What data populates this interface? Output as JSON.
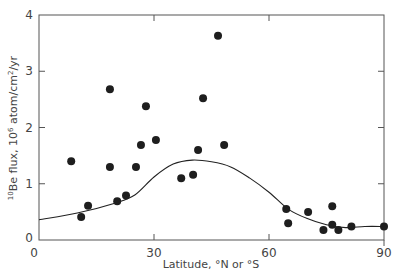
{
  "chart_data": {
    "type": "scatter",
    "title": "",
    "xlabel": "Latitude, °N or °S",
    "ylabel_parts": {
      "mass": "10",
      "element": "Be flux, 10",
      "exp": "6",
      "unit1": " atom/cm",
      "sq": "2",
      "unit2": "/yr"
    },
    "ylabel": "10Be flux, 10^6 atom/cm^2/yr",
    "xlim": [
      0,
      90
    ],
    "ylim": [
      0,
      4
    ],
    "xticks": [
      0,
      30,
      60,
      90
    ],
    "yticks": [
      0,
      1,
      2,
      3,
      4
    ],
    "grid": false,
    "legend": null,
    "series": [
      {
        "name": "observations",
        "kind": "scatter",
        "points": [
          [
            8.4,
            1.4
          ],
          [
            11.0,
            0.41
          ],
          [
            12.8,
            0.61
          ],
          [
            18.5,
            2.68
          ],
          [
            18.5,
            1.3
          ],
          [
            20.4,
            0.69
          ],
          [
            22.7,
            0.79
          ],
          [
            25.3,
            1.3
          ],
          [
            26.6,
            1.69
          ],
          [
            27.9,
            2.38
          ],
          [
            30.5,
            1.78
          ],
          [
            37.1,
            1.1
          ],
          [
            40.2,
            1.16
          ],
          [
            41.5,
            1.6
          ],
          [
            42.8,
            2.52
          ],
          [
            46.7,
            3.63
          ],
          [
            48.3,
            1.69
          ],
          [
            64.5,
            0.55
          ],
          [
            65.0,
            0.3
          ],
          [
            70.2,
            0.5
          ],
          [
            74.2,
            0.18
          ],
          [
            76.5,
            0.6
          ],
          [
            76.5,
            0.27
          ],
          [
            78.1,
            0.18
          ],
          [
            81.5,
            0.24
          ],
          [
            90.0,
            0.24
          ]
        ]
      },
      {
        "name": "model curve",
        "kind": "line",
        "points": [
          [
            0,
            0.36
          ],
          [
            10,
            0.48
          ],
          [
            20,
            0.66
          ],
          [
            25,
            0.8
          ],
          [
            30,
            1.12
          ],
          [
            35,
            1.35
          ],
          [
            40,
            1.42
          ],
          [
            45,
            1.39
          ],
          [
            50,
            1.3
          ],
          [
            55,
            1.1
          ],
          [
            60,
            0.85
          ],
          [
            65,
            0.55
          ],
          [
            70,
            0.38
          ],
          [
            75,
            0.27
          ],
          [
            80,
            0.22
          ],
          [
            85,
            0.24
          ],
          [
            90,
            0.24
          ]
        ]
      }
    ],
    "colors": {
      "ink": "#222222",
      "axis": "#555555"
    }
  }
}
